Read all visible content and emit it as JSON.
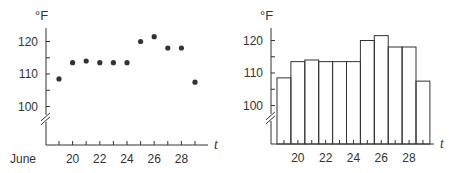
{
  "chart_data": [
    {
      "type": "scatter",
      "title": "",
      "xlabel": "t",
      "ylabel": "°F",
      "x_prefix_label": "June",
      "x": [
        19,
        20,
        21,
        22,
        23,
        24,
        25,
        26,
        27,
        28,
        29
      ],
      "values": [
        108.5,
        113.5,
        114,
        113.5,
        113.5,
        113.5,
        120,
        121.5,
        118,
        118,
        107.5
      ],
      "x_tick_labels": [
        "20",
        "22",
        "24",
        "26",
        "28"
      ],
      "y_tick_labels": [
        "100",
        "110",
        "120"
      ],
      "ylim": [
        95,
        125
      ],
      "axis_break": true,
      "grid": false
    },
    {
      "type": "bar",
      "title": "",
      "xlabel": "t",
      "ylabel": "°F",
      "categories": [
        19,
        20,
        21,
        22,
        23,
        24,
        25,
        26,
        27,
        28,
        29
      ],
      "values": [
        108.5,
        113.5,
        114,
        113.5,
        113.5,
        113.5,
        120,
        121.5,
        118,
        118,
        107.5
      ],
      "x_tick_labels": [
        "20",
        "22",
        "24",
        "26",
        "28"
      ],
      "y_tick_labels": [
        "100",
        "110",
        "120"
      ],
      "ylim": [
        95,
        125
      ],
      "axis_break": true,
      "grid": false,
      "bar_style": "outline"
    }
  ],
  "colors": {
    "ink": "#333333",
    "background": "#ffffff"
  }
}
